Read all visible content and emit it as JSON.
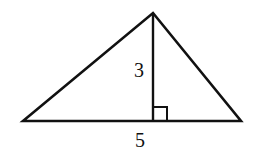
{
  "diagram": {
    "type": "triangle-with-altitude",
    "labels": {
      "height": "3",
      "base": "5"
    },
    "right_angle_marker": true,
    "stroke_color": "#111111",
    "background": "#ffffff"
  }
}
